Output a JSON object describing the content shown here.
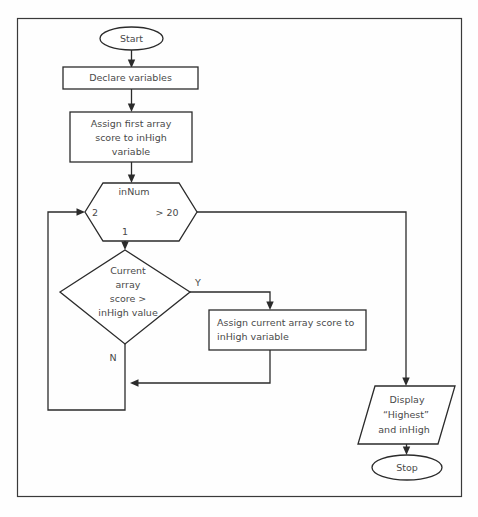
{
  "diagram": {
    "type": "flowchart",
    "title_text": "",
    "colors": {
      "background": "#fefefe",
      "stroke": "#2b2b2b",
      "text": "#4a4a4a",
      "frame": "#3a3a3a",
      "shape_fill": "#ffffff"
    },
    "frame": {
      "x": 17,
      "y": 18,
      "width": 445,
      "height": 479
    },
    "nodes": [
      {
        "id": "start",
        "shape": "terminator",
        "label": "Start",
        "lines": [
          "Start"
        ],
        "cx": 131.5,
        "cy": 38.5,
        "rx": 31.5,
        "ry": 11.5
      },
      {
        "id": "declare",
        "shape": "process",
        "label": "Declare variables",
        "lines": [
          "Declare variables"
        ],
        "x": 63,
        "y": 67,
        "width": 135,
        "height": 22
      },
      {
        "id": "assign-first",
        "shape": "process",
        "label": "Assign first array score to inHigh variable",
        "lines": [
          "Assign first array",
          "score to inHigh",
          "variable"
        ],
        "x": 70,
        "y": 112,
        "width": 122,
        "height": 50
      },
      {
        "id": "loop-hexagon",
        "shape": "preparation",
        "label": "inNum",
        "lines": [
          "inNum"
        ],
        "left_label": "2",
        "right_label": "> 20",
        "bottom_label": "1",
        "x": 85,
        "y": 183,
        "width": 112,
        "height": 58
      },
      {
        "id": "decision",
        "shape": "decision",
        "label": "Current array score > inHigh value",
        "lines": [
          "Current",
          "array",
          "score >",
          "inHigh value"
        ],
        "cx": 125,
        "cy": 292,
        "half_width": 65,
        "half_height": 52,
        "yes_label": "Y",
        "no_label": "N"
      },
      {
        "id": "assign-current",
        "shape": "process",
        "label": "Assign current array score to inHigh variable",
        "lines": [
          "Assign current array score to",
          "inHigh variable"
        ],
        "x": 209,
        "y": 310,
        "width": 157,
        "height": 40
      },
      {
        "id": "display",
        "shape": "output",
        "label": "Display \"Highest\" and inHigh",
        "lines": [
          "Display",
          "“Highest”",
          "and inHigh"
        ],
        "x": 358,
        "y": 386,
        "width": 97,
        "height": 58,
        "slant": 17
      },
      {
        "id": "stop",
        "shape": "terminator",
        "label": "Stop",
        "lines": [
          "Stop"
        ],
        "cx": 407,
        "cy": 467.5,
        "rx": 35,
        "ry": 12.5
      }
    ],
    "edges": [
      {
        "id": "start-to-declare",
        "from": "start",
        "to": "declare",
        "label": ""
      },
      {
        "id": "declare-to-assign-first",
        "from": "declare",
        "to": "assign-first",
        "label": ""
      },
      {
        "id": "assign-first-to-loop",
        "from": "assign-first",
        "to": "loop-hexagon",
        "label": ""
      },
      {
        "id": "loop-to-decision",
        "from": "loop-hexagon",
        "to": "decision",
        "label": "1"
      },
      {
        "id": "decision-yes",
        "from": "decision",
        "to": "assign-current",
        "label": "Y"
      },
      {
        "id": "decision-no",
        "from": "decision",
        "to": "loop-hexagon",
        "label": "N"
      },
      {
        "id": "assign-current-to-merge",
        "from": "assign-current",
        "to": "loop-hexagon",
        "label": ""
      },
      {
        "id": "loop-exit",
        "from": "loop-hexagon",
        "to": "display",
        "label": "> 20"
      },
      {
        "id": "display-to-stop",
        "from": "display",
        "to": "stop",
        "label": ""
      }
    ]
  }
}
